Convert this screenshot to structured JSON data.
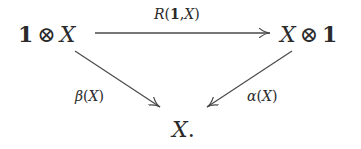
{
  "diagram": {
    "type": "commutative-triangle",
    "nodes": {
      "top_left": {
        "left": "1",
        "op": "⊗",
        "right": "X"
      },
      "top_right": {
        "left": "X",
        "op": "⊗",
        "right": "1"
      },
      "bottom": {
        "symbol": "X",
        "punct": "."
      }
    },
    "arrows": {
      "top": {
        "name": "R",
        "open": "(",
        "arg1": "1",
        "sep": ",",
        "arg2": "X",
        "close": ")",
        "from": "1 ⊗ X",
        "to": "X ⊗ 1"
      },
      "left": {
        "name": "β",
        "open": "(",
        "arg": "X",
        "close": ")",
        "from": "1 ⊗ X",
        "to": "X"
      },
      "right": {
        "name": "α",
        "open": "(",
        "arg": "X",
        "close": ")",
        "from": "X ⊗ 1",
        "to": "X"
      }
    },
    "colors": {
      "ink": "#2a2a2a",
      "arrow": "#4a4a4a",
      "background": "#ffffff"
    }
  }
}
